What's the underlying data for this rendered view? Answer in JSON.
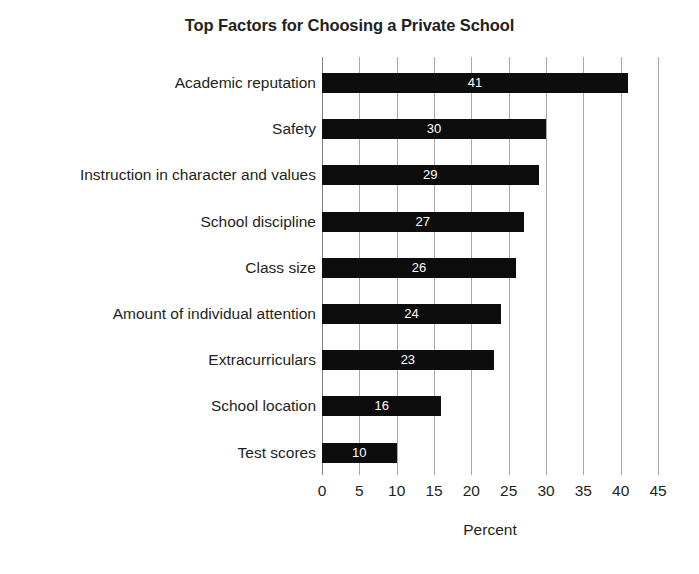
{
  "chart_data": {
    "type": "bar",
    "orientation": "horizontal",
    "title": "Top Factors for Choosing a Private School",
    "xlabel": "Percent",
    "ylabel": "",
    "categories": [
      "Academic reputation",
      "Safety",
      "Instruction in character and values",
      "School discipline",
      "Class size",
      "Amount of individual attention",
      "Extracurriculars",
      "School location",
      "Test scores"
    ],
    "values": [
      41,
      30,
      29,
      27,
      26,
      24,
      23,
      16,
      10
    ],
    "data_labels": [
      "41",
      "30",
      "29",
      "27",
      "26",
      "24",
      "23",
      "16",
      "10"
    ],
    "xlim": [
      0,
      45
    ],
    "xticks": [
      0,
      5,
      10,
      15,
      20,
      25,
      30,
      35,
      40,
      45
    ],
    "xtick_labels": [
      "0",
      "5",
      "10",
      "15",
      "20",
      "25",
      "30",
      "35",
      "40",
      "45"
    ],
    "grid": "vertical",
    "legend": "none",
    "bar_color": "#0d0d0d",
    "data_label_color": "#ffffff",
    "gridline_color": "#a7a9ac",
    "background_color": "#ffffff",
    "text_color": "#231f20"
  }
}
